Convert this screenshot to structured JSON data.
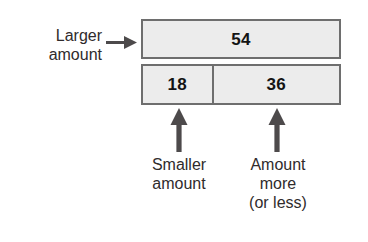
{
  "diagram": {
    "colors": {
      "bar_fill": "#ececec",
      "bar_border": "#6e6e6e",
      "text": "#2f2b2c",
      "value_text": "#141414",
      "arrow": "#4d4a4b",
      "background": "#ffffff"
    },
    "bars": {
      "top": {
        "value": "54",
        "label_ref": "larger-amount"
      },
      "bottom": {
        "segments": [
          {
            "value": "18",
            "label_ref": "smaller-amount",
            "width_fraction": 0.36
          },
          {
            "value": "36",
            "label_ref": "amount-more",
            "width_fraction": 0.64
          }
        ]
      }
    },
    "labels": {
      "larger_amount": "Larger\namount",
      "smaller_amount": "Smaller\namount",
      "amount_more": "Amount\nmore\n(or less)"
    },
    "icons": {
      "arrow_right": "arrow-right-icon",
      "arrow_up": "arrow-up-icon"
    }
  }
}
